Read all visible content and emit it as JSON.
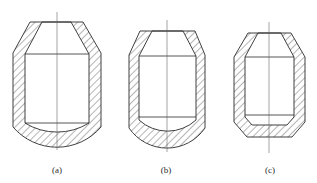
{
  "diagram": {
    "type": "cross-section drawings of hollow cylindrical vessels with conical tops",
    "figures": [
      {
        "id": "a",
        "label": "(a)",
        "description": "hatched wall section with conical top opening and spherical (curved) bottom"
      },
      {
        "id": "b",
        "label": "(b)",
        "description": "hatched wall section with conical top opening and rounded bottom"
      },
      {
        "id": "c",
        "label": "(c)",
        "description": "hatched wall section with conical top opening and flat chamfered bottom"
      }
    ],
    "colors": {
      "line": "#2b2b2b",
      "hatch": "#3a3a3a",
      "center_line": "#5a5a5a",
      "background": "#ffffff"
    }
  }
}
